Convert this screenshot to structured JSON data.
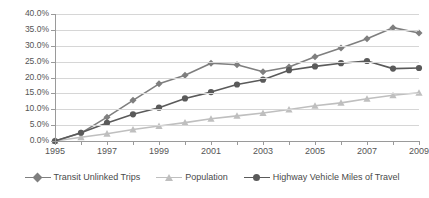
{
  "chart_data": {
    "type": "line",
    "title": "",
    "subtitle": "",
    "xlabel": "",
    "ylabel": "",
    "grid": true,
    "legend_position": "bottom",
    "x": [
      1995,
      1996,
      1997,
      1998,
      1999,
      2000,
      2001,
      2002,
      2003,
      2004,
      2005,
      2006,
      2007,
      2008,
      2009
    ],
    "xlim": [
      1995,
      2009
    ],
    "x_tick_labels": [
      "1995",
      "1997",
      "1999",
      "2001",
      "2003",
      "2005",
      "2007",
      "2009"
    ],
    "x_tick_values": [
      1995,
      1997,
      1999,
      2001,
      2003,
      2005,
      2007,
      2009
    ],
    "ylim": [
      0,
      40
    ],
    "y_tick_labels": [
      "0.0%",
      "5.0%",
      "10.0%",
      "15.0%",
      "20.0%",
      "25.0%",
      "30.0%",
      "35.0%",
      "40.0%"
    ],
    "y_tick_values": [
      0,
      5,
      10,
      15,
      20,
      25,
      30,
      35,
      40
    ],
    "series": [
      {
        "name": "Transit Unlinked Trips",
        "marker": "diamond",
        "color": "#7f7f7f",
        "values": [
          0.0,
          2.5,
          7.5,
          12.8,
          18.0,
          20.7,
          24.5,
          24.0,
          21.8,
          23.3,
          26.5,
          29.3,
          32.2,
          35.7,
          34.0
        ]
      },
      {
        "name": "Population",
        "marker": "triangle",
        "color": "#bfbfbf",
        "values": [
          0.0,
          1.2,
          2.3,
          3.6,
          4.7,
          5.8,
          7.0,
          7.9,
          8.8,
          9.9,
          11.1,
          12.0,
          13.3,
          14.4,
          15.2
        ]
      },
      {
        "name": "Highway Vehicle Miles of Travel",
        "marker": "circle",
        "color": "#5a5a5a",
        "values": [
          0.0,
          2.6,
          5.7,
          8.4,
          10.5,
          13.4,
          15.4,
          17.8,
          19.3,
          22.3,
          23.5,
          24.5,
          25.2,
          22.8,
          23.0
        ]
      }
    ]
  },
  "colors": {
    "gridline": "#d6d6d6",
    "axis": "#9a9a9a",
    "tick_text": "#555555",
    "legend_text": "#4a4a4a",
    "background": "#ffffff"
  }
}
